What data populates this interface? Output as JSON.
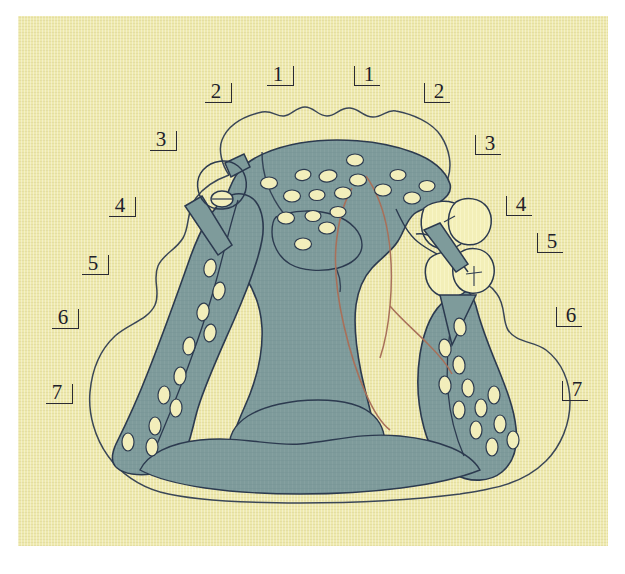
{
  "figure": {
    "paper_color": "#eee9ad",
    "outer_color": "#ffffff"
  },
  "palette": {
    "background": "#eee9ad",
    "tissue_teal": "#7e9b9b",
    "tissue_teal_dark": "#6e8d8e",
    "outline_navy": "#2c3a4f",
    "outline_thin": "#3a4657",
    "tooth_cream": "#f3efb8",
    "spot_cream": "#f2eebb",
    "red_line": "#a8705a",
    "label_ink": "#20202a"
  },
  "labels": {
    "left": [
      {
        "id": "label-left-2",
        "text": "2",
        "bracket": "right",
        "x": 203,
        "y": 79
      },
      {
        "id": "label-left-1",
        "text": "1",
        "bracket": "right",
        "x": 265,
        "y": 62
      },
      {
        "id": "label-left-3",
        "text": "3",
        "bracket": "right",
        "x": 148,
        "y": 127
      },
      {
        "id": "label-left-4",
        "text": "4",
        "bracket": "right",
        "x": 107,
        "y": 193
      },
      {
        "id": "label-left-5",
        "text": "5",
        "bracket": "right",
        "x": 80,
        "y": 251
      },
      {
        "id": "label-left-6",
        "text": "6",
        "bracket": "right",
        "x": 50,
        "y": 305
      },
      {
        "id": "label-left-7",
        "text": "7",
        "bracket": "right",
        "x": 44,
        "y": 380
      }
    ],
    "right": [
      {
        "id": "label-right-1",
        "text": "1",
        "bracket": "left",
        "x": 350,
        "y": 62
      },
      {
        "id": "label-right-2",
        "text": "2",
        "bracket": "left",
        "x": 420,
        "y": 79
      },
      {
        "id": "label-right-3",
        "text": "3",
        "bracket": "left",
        "x": 471,
        "y": 131
      },
      {
        "id": "label-right-4",
        "text": "4",
        "bracket": "left",
        "x": 502,
        "y": 192
      },
      {
        "id": "label-right-5",
        "text": "5",
        "bracket": "left",
        "x": 533,
        "y": 229
      },
      {
        "id": "label-right-6",
        "text": "6",
        "bracket": "left",
        "x": 552,
        "y": 303
      },
      {
        "id": "label-right-7",
        "text": "7",
        "bracket": "left",
        "x": 558,
        "y": 377
      }
    ]
  },
  "regions": [
    {
      "name": "palatal-vault-shaded-area",
      "color": "#7e9b9b"
    },
    {
      "name": "soft-tissue-outline",
      "color": "#2c3a4f"
    },
    {
      "name": "posterior-teeth-cream",
      "color": "#f3efb8"
    },
    {
      "name": "glandular-foramina-spots",
      "color": "#f2eebb"
    },
    {
      "name": "denture-border-outline-red",
      "color": "#a8705a"
    }
  ]
}
